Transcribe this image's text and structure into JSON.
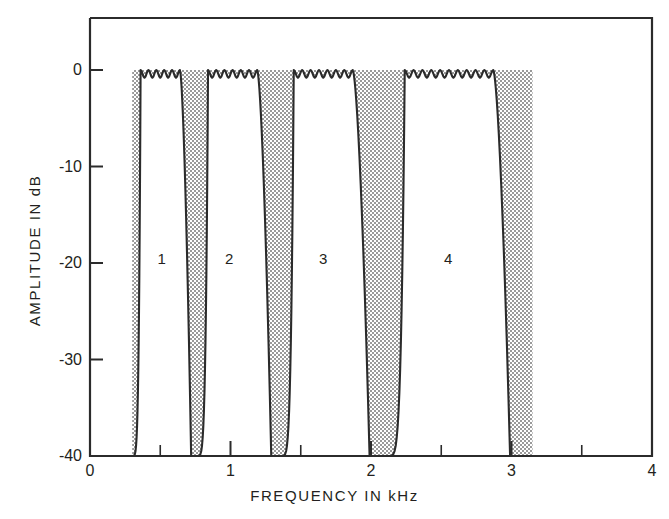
{
  "chart_data": {
    "type": "line",
    "title": "",
    "xlabel": "FREQUENCY IN kHz",
    "ylabel": "AMPLITUDE IN dB",
    "xlim": [
      0,
      4
    ],
    "ylim": [
      -40,
      5
    ],
    "xticks": [
      0,
      1,
      2,
      3,
      4
    ],
    "xtick_labels": [
      "0",
      "1",
      "2",
      "3",
      "4"
    ],
    "xminor_ticks": [
      0.5,
      1.5,
      2.5,
      3.5
    ],
    "yticks": [
      0,
      -10,
      -20,
      -30,
      -40
    ],
    "ytick_labels": [
      "0",
      "-10",
      "-20",
      "-30",
      "-40"
    ],
    "grid": false,
    "legend": "none",
    "passband_ripple_db": 0.8,
    "stopband_floor_db": -40,
    "shading_extent_khz": [
      0.3,
      3.15
    ],
    "series": [
      {
        "name": "1",
        "label": "1",
        "label_x_khz": 0.51,
        "label_y_db": -19.5,
        "passband_khz": [
          0.36,
          0.64
        ],
        "transition_lower_khz": [
          0.3,
          0.36
        ],
        "transition_upper_khz": [
          0.64,
          0.72
        ],
        "band_edges_khz": [
          0.3,
          0.72
        ],
        "ripple_lobes": 5
      },
      {
        "name": "2",
        "label": "2",
        "label_x_khz": 0.99,
        "label_y_db": -19.5,
        "passband_khz": [
          0.84,
          1.19
        ],
        "transition_lower_khz": [
          0.76,
          0.84
        ],
        "transition_upper_khz": [
          1.19,
          1.29
        ],
        "band_edges_khz": [
          0.76,
          1.29
        ],
        "ripple_lobes": 6
      },
      {
        "name": "3",
        "label": "3",
        "label_x_khz": 1.66,
        "label_y_db": -19.5,
        "passband_khz": [
          1.45,
          1.87
        ],
        "transition_lower_khz": [
          1.36,
          1.45
        ],
        "transition_upper_khz": [
          1.87,
          1.99
        ],
        "band_edges_khz": [
          1.36,
          1.99
        ],
        "ripple_lobes": 7
      },
      {
        "name": "4",
        "label": "4",
        "label_x_khz": 2.55,
        "label_y_db": -19.5,
        "passband_khz": [
          2.24,
          2.87
        ],
        "transition_lower_khz": [
          2.12,
          2.24
        ],
        "transition_upper_khz": [
          2.87,
          2.99
        ],
        "band_edges_khz": [
          2.12,
          2.99
        ],
        "ripple_lobes": 10
      }
    ]
  },
  "style": {
    "line_color": "#2b2b2b",
    "frame_color": "#2b2b2b",
    "shade_color": "#bdbdbd",
    "background": "#ffffff",
    "text_color": "#231f20"
  }
}
